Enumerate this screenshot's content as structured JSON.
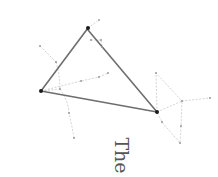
{
  "caption": "The",
  "colors": {
    "asterism_line": "#6e6e6e",
    "constellation_line": "#c8c8c8",
    "major_star": "#1a1a1a",
    "minor_star": "#9a9a9a",
    "caption": "#555555"
  },
  "asterism": {
    "name": "triangle",
    "vertices": [
      "top-star",
      "left-star",
      "right-star"
    ]
  },
  "constellations": [
    {
      "name": "left-figure",
      "stars": [
        "faint-a",
        "faint-b",
        "left-star",
        "faint-c",
        "faint-d"
      ]
    },
    {
      "name": "center-figure",
      "stars": [
        "left-star",
        "faint-e",
        "faint-f",
        "faint-g"
      ]
    },
    {
      "name": "top-figure",
      "stars": [
        "top-star",
        "faint-h",
        "faint-i",
        "faint-j"
      ]
    },
    {
      "name": "right-figure",
      "stars": [
        "right-star",
        "faint-k",
        "faint-l",
        "faint-m",
        "faint-n",
        "faint-o",
        "faint-p"
      ]
    }
  ]
}
